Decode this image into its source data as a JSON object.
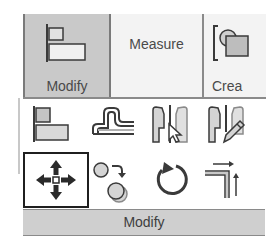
{
  "ribbon": {
    "tabs": [
      {
        "label": "Modify",
        "icon": "modify-align-icon",
        "active": true
      },
      {
        "label": "Measure",
        "icon": null,
        "active": false
      },
      {
        "label": "Crea",
        "icon": "create-icon",
        "active": false
      }
    ]
  },
  "panel": {
    "title": "Modify",
    "tools": [
      {
        "name": "align",
        "icon": "align-icon"
      },
      {
        "name": "offset",
        "icon": "offset-icon"
      },
      {
        "name": "mirror-pick-axis",
        "icon": "mirror-pick-axis-icon"
      },
      {
        "name": "mirror-draw-axis",
        "icon": "mirror-draw-axis-icon"
      },
      {
        "name": "move",
        "icon": "move-icon",
        "selected": true
      },
      {
        "name": "copy",
        "icon": "copy-icon"
      },
      {
        "name": "rotate",
        "icon": "rotate-icon"
      },
      {
        "name": "trim-extend",
        "icon": "trim-extend-icon"
      }
    ]
  },
  "colors": {
    "active_tab_bg": "#c9c9c9",
    "panel_bar_bg": "#cfcfcf",
    "icon_dark": "#3a3a3a",
    "icon_fill": "#d4d4d4"
  }
}
